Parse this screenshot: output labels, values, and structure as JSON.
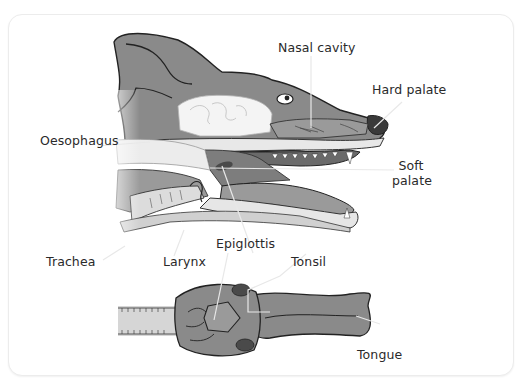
{
  "diagram": {
    "labels": {
      "nasal_cavity": "Nasal cavity",
      "hard_palate": "Hard palate",
      "oesophagus": "Oesophagus",
      "soft_palate_line1": "Soft",
      "soft_palate_line2": "palate",
      "trachea": "Trachea",
      "larynx": "Larynx",
      "epiglottis": "Epiglottis",
      "tonsil": "Tonsil",
      "tongue": "Tongue"
    },
    "colors": {
      "skin": "#8a8a8a",
      "skin_dark": "#6e6e6e",
      "outline": "#222222",
      "tissue_light": "#e6e6e6",
      "tissue_mid": "#bdbdbd",
      "tonsil": "#4a4a4a",
      "leader_line": "#e8e8e8",
      "text": "#2a2a2a"
    }
  }
}
